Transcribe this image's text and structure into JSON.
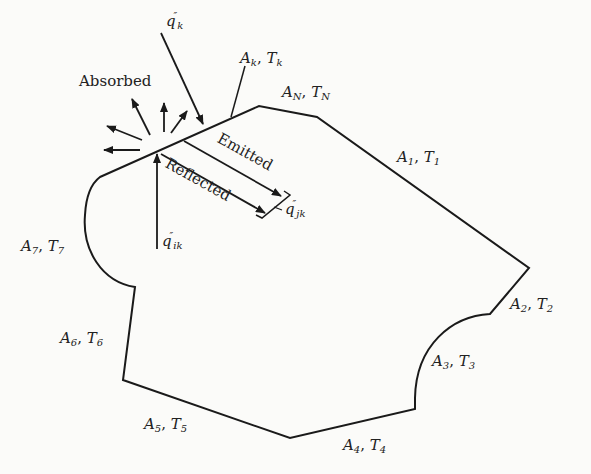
{
  "diagram": {
    "surfaces": [
      {
        "id": "1",
        "area": "A",
        "sub": "1",
        "temp": "T",
        "tsub": "1"
      },
      {
        "id": "2",
        "area": "A",
        "sub": "2",
        "temp": "T",
        "tsub": "2"
      },
      {
        "id": "3",
        "area": "A",
        "sub": "3",
        "temp": "T",
        "tsub": "3"
      },
      {
        "id": "4",
        "area": "A",
        "sub": "4",
        "temp": "T",
        "tsub": "4"
      },
      {
        "id": "5",
        "area": "A",
        "sub": "5",
        "temp": "T",
        "tsub": "5"
      },
      {
        "id": "6",
        "area": "A",
        "sub": "6",
        "temp": "T",
        "tsub": "6"
      },
      {
        "id": "7",
        "area": "A",
        "sub": "7",
        "temp": "T",
        "tsub": "7"
      },
      {
        "id": "k",
        "area": "A",
        "sub": "k",
        "temp": "T",
        "tsub": "k"
      },
      {
        "id": "N",
        "area": "A",
        "sub": "N",
        "temp": "T",
        "tsub": "N"
      }
    ],
    "arrows": {
      "absorbed": "Absorbed",
      "emitted": "Emitted",
      "reflected": "Reflected"
    },
    "fluxes": {
      "incident_k": {
        "q": "q",
        "prime": "″",
        "sub": "k"
      },
      "incident_ik": {
        "q": "q",
        "prime": "″",
        "sub": "ik"
      },
      "leaving_jk": {
        "q": "q",
        "prime": "″",
        "sub": "jk"
      }
    },
    "colors": {
      "line": "#1a1a1a",
      "background": "#fbfbf9"
    }
  }
}
